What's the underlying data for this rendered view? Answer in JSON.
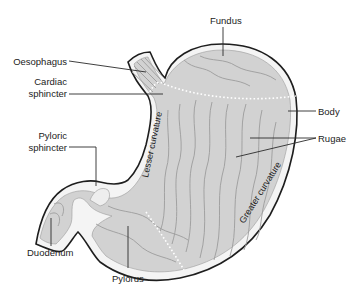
{
  "figure": {
    "colors": {
      "outline": "#1e1e1e",
      "wall": "#f4f4f4",
      "mucosa": "#d2d2d2",
      "folds": "#9c9c9c",
      "text": "#222222"
    }
  },
  "labels": {
    "fundus": "Fundus",
    "oesophagus": "Oesophagus",
    "cardiac_sphincter_line1": "Cardiac",
    "cardiac_sphincter_line2": "sphincter",
    "pyloric_sphincter_line1": "Pyloric",
    "pyloric_sphincter_line2": "sphincter",
    "body": "Body",
    "rugae": "Rugae",
    "duodenum": "Duodenum",
    "pylorus": "Pylorus",
    "lesser_curvature": "Lesser curvature",
    "greater_curvature": "Greater curvature"
  }
}
